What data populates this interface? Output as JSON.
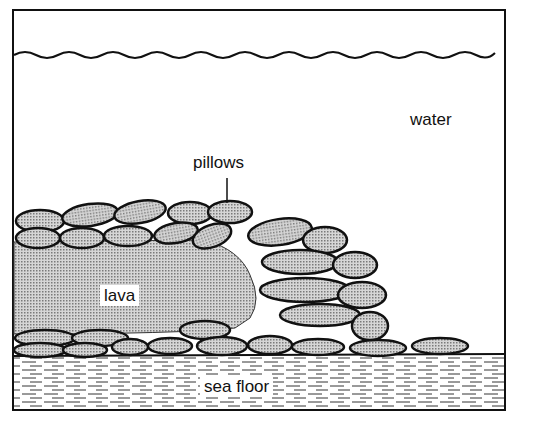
{
  "diagram": {
    "labels": {
      "water": "water",
      "pillows": "pillows",
      "lava": "lava",
      "sea_floor": "sea floor"
    },
    "colors": {
      "ink": "#111111",
      "lava_fill": "#c8c8c8",
      "background": "#ffffff"
    }
  }
}
